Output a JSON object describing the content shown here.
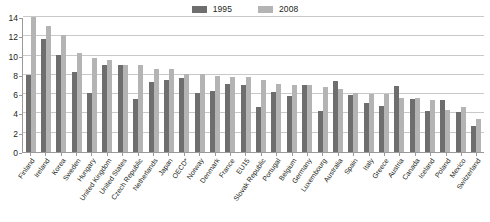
{
  "legend": {
    "entries": [
      {
        "label": "1995",
        "color": "#6e6e6e"
      },
      {
        "label": "2008",
        "color": "#b4b4b4"
      }
    ]
  },
  "axis": {
    "y_ticks": [
      "0",
      "2",
      "4",
      "6",
      "8",
      "10",
      "12",
      "14"
    ]
  },
  "chart_data": {
    "type": "bar",
    "title": "",
    "subtitle": "",
    "xlabel": "",
    "ylabel": "",
    "ylim": [
      0,
      14
    ],
    "ytick_values": [
      0,
      2,
      4,
      6,
      8,
      10,
      12,
      14
    ],
    "grid": true,
    "legend_position": "top-center",
    "colors": {
      "1995": "#6e6e6e",
      "2008": "#b4b4b4"
    },
    "categories": [
      "Finland",
      "Ireland",
      "Korea",
      "Sweden",
      "Hungary",
      "United Kingdom",
      "United States",
      "Czech Republic",
      "Netherlands",
      "Japan",
      "OECD*",
      "Norway",
      "Denmark",
      "France",
      "EU15",
      "Slovak Republic",
      "Portugal",
      "Belgium",
      "Germany",
      "Luxembourg",
      "Australia",
      "Spain",
      "Italy",
      "Greece",
      "Austria",
      "Canada",
      "Iceland",
      "Poland",
      "Mexico",
      "Switzerland"
    ],
    "series": [
      {
        "name": "1995",
        "values": [
          8.0,
          11.7,
          10.1,
          8.25,
          6.1,
          9.0,
          9.0,
          5.5,
          7.25,
          7.5,
          7.65,
          6.15,
          6.3,
          7.05,
          6.9,
          4.7,
          6.2,
          5.85,
          6.95,
          4.25,
          7.35,
          5.9,
          5.05,
          4.75,
          6.85,
          5.5,
          4.3,
          5.4,
          4.15,
          2.7
        ]
      },
      {
        "name": "2008",
        "values": [
          14.0,
          13.1,
          12.1,
          10.25,
          9.8,
          9.5,
          9.0,
          9.0,
          8.6,
          8.6,
          8.05,
          8.05,
          7.9,
          7.75,
          7.75,
          7.45,
          7.1,
          6.9,
          6.9,
          6.7,
          6.5,
          6.15,
          6.0,
          6.05,
          5.65,
          5.6,
          5.35,
          4.35,
          4.65,
          3.4
        ]
      }
    ]
  }
}
